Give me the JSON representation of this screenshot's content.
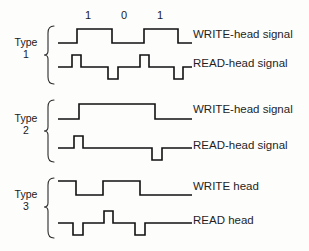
{
  "figure": {
    "background_color": "#fdfdfc",
    "line_color": "#111111"
  },
  "bit_labels": [
    {
      "text": "1",
      "x": 88
    },
    {
      "text": "0",
      "x": 124
    },
    {
      "text": "1",
      "x": 160
    }
  ],
  "groups": [
    {
      "name": "type-1",
      "type_word": "Type",
      "type_number": "1",
      "brace": {
        "x": 48,
        "y": 26,
        "height": 58
      },
      "label_x": 12,
      "label_y": 42,
      "rows": [
        {
          "name": "write",
          "label": "WRITE-head signal",
          "label_x": 193,
          "label_y": 35,
          "baseline_y": 43,
          "high_y": 29,
          "points": "58,43 77,43 77,29 112,29 112,43 144,43 144,29 178,29 178,43 192,43"
        },
        {
          "name": "read",
          "label": "READ-head signal",
          "label_x": 193,
          "label_y": 64,
          "baseline_y": 67,
          "high_y": 55,
          "points": "58,67 72,67 72,55 81,55 81,67 108,67 108,79 118,79 118,67 140,67 140,55 149,55 149,67 174,67 174,79 183,79 183,67 192,67"
        }
      ]
    },
    {
      "name": "type-2",
      "type_word": "Type",
      "type_number": "2",
      "brace": {
        "x": 48,
        "y": 100,
        "height": 62
      },
      "label_x": 12,
      "label_y": 118,
      "rows": [
        {
          "name": "write",
          "label": "WRITE-head signal",
          "label_x": 193,
          "label_y": 110,
          "baseline_y": 119,
          "high_y": 104,
          "points": "58,119 79,119 79,104 155,104 155,119 192,119"
        },
        {
          "name": "read",
          "label": "READ-head signal",
          "label_x": 193,
          "label_y": 146,
          "baseline_y": 148,
          "high_y": 136,
          "points": "58,148 74,148 74,136 83,136 83,148 152,148 152,160 162,160 162,148 192,148"
        }
      ]
    },
    {
      "name": "type-3",
      "type_word": "Type",
      "type_number": "3",
      "brace": {
        "x": 48,
        "y": 178,
        "height": 60
      },
      "label_x": 12,
      "label_y": 194,
      "rows": [
        {
          "name": "write",
          "label": "WRITE head",
          "label_x": 193,
          "label_y": 187,
          "baseline_y": 195,
          "high_y": 181,
          "points": "58,181 76,181 76,195 103,195 103,181 140,181 140,195 192,195"
        },
        {
          "name": "read",
          "label": "READ head",
          "label_x": 193,
          "label_y": 221,
          "baseline_y": 223,
          "high_y": 211,
          "points": "58,223 73,223 73,235 83,235 83,223 104,223 104,211 113,211 113,223 135,223 135,235 145,235 145,223 192,223"
        }
      ]
    }
  ]
}
